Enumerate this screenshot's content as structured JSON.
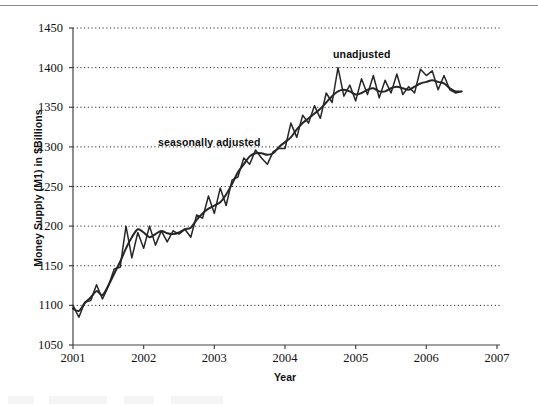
{
  "page": {
    "background_color": "#ffffff",
    "rule_color": "#8d8d8d"
  },
  "chart_data": {
    "type": "line",
    "title": "",
    "xlabel": "Year",
    "ylabel": "Money Supply (M1) in $Billions",
    "xlim": [
      2001,
      2007
    ],
    "ylim": [
      1050,
      1450
    ],
    "xticks": [
      "2001",
      "2002",
      "2003",
      "2004",
      "2005",
      "2006",
      "2007"
    ],
    "yticks": [
      "1050",
      "1100",
      "1150",
      "1200",
      "1250",
      "1300",
      "1350",
      "1400",
      "1450"
    ],
    "grid": "horizontal-dotted",
    "legend_position": "inline-annotations",
    "annotations": [
      {
        "text": "seasonally adjusted",
        "x": 2002.35,
        "y": 1310
      },
      {
        "text": "unadjusted",
        "x": 2004.82,
        "y": 1425
      }
    ],
    "line_color": "#262626",
    "series": [
      {
        "name": "seasonally adjusted",
        "smooth": true,
        "x": [
          2001.0,
          2001.083,
          2001.167,
          2001.25,
          2001.333,
          2001.417,
          2001.5,
          2001.583,
          2001.667,
          2001.75,
          2001.833,
          2001.917,
          2002.0,
          2002.083,
          2002.167,
          2002.25,
          2002.333,
          2002.417,
          2002.5,
          2002.583,
          2002.667,
          2002.75,
          2002.833,
          2002.917,
          2003.0,
          2003.083,
          2003.167,
          2003.25,
          2003.333,
          2003.417,
          2003.5,
          2003.583,
          2003.667,
          2003.75,
          2003.833,
          2003.917,
          2004.0,
          2004.083,
          2004.167,
          2004.25,
          2004.333,
          2004.417,
          2004.5,
          2004.583,
          2004.667,
          2004.75,
          2004.833,
          2004.917,
          2005.0,
          2005.083,
          2005.167,
          2005.25,
          2005.333,
          2005.417,
          2005.5,
          2005.583,
          2005.667,
          2005.75,
          2005.833,
          2005.917,
          2006.0,
          2006.083,
          2006.167,
          2006.25,
          2006.333,
          2006.417,
          2006.5
        ],
        "values": [
          1096,
          1093,
          1103,
          1110,
          1118,
          1113,
          1125,
          1140,
          1155,
          1172,
          1186,
          1196,
          1192,
          1186,
          1190,
          1194,
          1191,
          1190,
          1192,
          1196,
          1198,
          1208,
          1216,
          1222,
          1226,
          1230,
          1240,
          1253,
          1268,
          1278,
          1288,
          1292,
          1292,
          1290,
          1292,
          1300,
          1306,
          1312,
          1322,
          1330,
          1336,
          1342,
          1348,
          1356,
          1364,
          1370,
          1372,
          1370,
          1366,
          1368,
          1372,
          1374,
          1370,
          1370,
          1374,
          1376,
          1374,
          1372,
          1376,
          1380,
          1382,
          1384,
          1382,
          1380,
          1374,
          1370,
          1370
        ]
      },
      {
        "name": "unadjusted",
        "smooth": false,
        "x": [
          2001.0,
          2001.083,
          2001.167,
          2001.25,
          2001.333,
          2001.417,
          2001.5,
          2001.583,
          2001.667,
          2001.75,
          2001.833,
          2001.917,
          2002.0,
          2002.083,
          2002.167,
          2002.25,
          2002.333,
          2002.417,
          2002.5,
          2002.583,
          2002.667,
          2002.75,
          2002.833,
          2002.917,
          2003.0,
          2003.083,
          2003.167,
          2003.25,
          2003.333,
          2003.417,
          2003.5,
          2003.583,
          2003.667,
          2003.75,
          2003.833,
          2003.917,
          2004.0,
          2004.083,
          2004.167,
          2004.25,
          2004.333,
          2004.417,
          2004.5,
          2004.583,
          2004.667,
          2004.75,
          2004.833,
          2004.917,
          2005.0,
          2005.083,
          2005.167,
          2005.25,
          2005.333,
          2005.417,
          2005.5,
          2005.583,
          2005.667,
          2005.75,
          2005.833,
          2005.917,
          2006.0,
          2006.083,
          2006.167,
          2006.25,
          2006.333,
          2006.417,
          2006.5
        ],
        "values": [
          1100,
          1085,
          1104,
          1106,
          1126,
          1108,
          1124,
          1146,
          1148,
          1200,
          1160,
          1192,
          1172,
          1200,
          1176,
          1194,
          1180,
          1194,
          1190,
          1196,
          1186,
          1214,
          1210,
          1238,
          1216,
          1248,
          1226,
          1258,
          1262,
          1286,
          1278,
          1296,
          1286,
          1278,
          1294,
          1298,
          1298,
          1330,
          1312,
          1340,
          1330,
          1352,
          1336,
          1368,
          1356,
          1400,
          1364,
          1378,
          1358,
          1386,
          1366,
          1390,
          1362,
          1384,
          1368,
          1392,
          1366,
          1376,
          1368,
          1398,
          1390,
          1396,
          1372,
          1390,
          1372,
          1368,
          1370
        ]
      }
    ]
  }
}
